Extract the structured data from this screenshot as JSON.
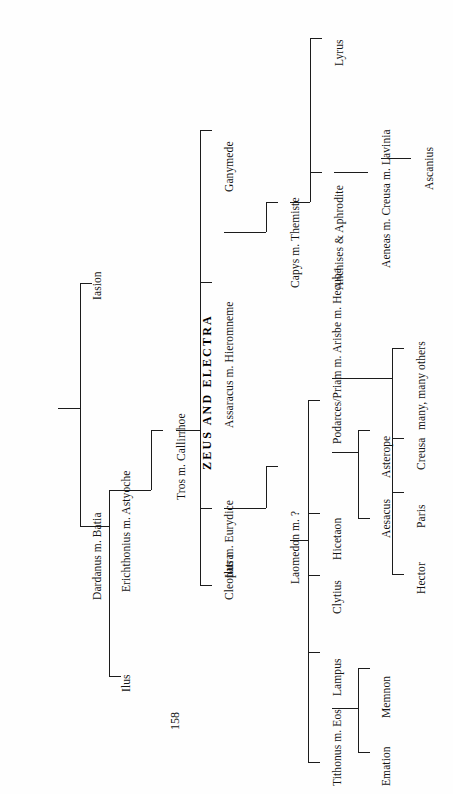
{
  "document": {
    "title": "ZEUS AND ELECTRA",
    "page_number": "158",
    "orientation": "rotated-90-ccw",
    "kind": "genealogy-chart"
  },
  "tree": {
    "root_label": "ZEUS AND ELECTRA",
    "generations": [
      {
        "level": 1,
        "nodes": [
          {
            "id": "iasion",
            "label": "Iasion"
          },
          {
            "id": "dardanus",
            "label": "Dardanus m. Batia"
          }
        ]
      },
      {
        "level": 2,
        "nodes": [
          {
            "id": "erichthonius",
            "label": "Erichthonius m. Astyoche"
          },
          {
            "id": "ilus1",
            "label": "Ilus"
          }
        ]
      },
      {
        "level": 3,
        "nodes": [
          {
            "id": "tros",
            "label": "Tros m. Callirrhoe"
          }
        ]
      },
      {
        "level": 4,
        "nodes": [
          {
            "id": "ganymede",
            "label": "Ganymede"
          },
          {
            "id": "assaracus",
            "label": "Assaracus m. Hieromneme"
          },
          {
            "id": "ilus2",
            "label": "Ilus m. Eurydice"
          },
          {
            "id": "cleopatra",
            "label": "Cleopatra"
          }
        ]
      },
      {
        "level": 5,
        "nodes": [
          {
            "id": "capys",
            "label": "Capys m. Themiste"
          },
          {
            "id": "laomedon",
            "label": "Laomedon m. ?"
          }
        ]
      },
      {
        "level": 6,
        "nodes": [
          {
            "id": "lyrus",
            "label": "Lyrus"
          },
          {
            "id": "anchises",
            "label": "Anchises & Aphrodite"
          },
          {
            "id": "hicetaon",
            "label": "Hicetaon"
          },
          {
            "id": "clytius",
            "label": "Clytius"
          },
          {
            "id": "lampus",
            "label": "Lampus"
          },
          {
            "id": "tithonus",
            "label": "Tithonus m. Eos"
          },
          {
            "id": "podarces",
            "label": "Podarces/Priam m. Arisbe  m. Hecuba"
          }
        ]
      },
      {
        "level": 7,
        "nodes": [
          {
            "id": "aeneas",
            "label": "Aeneas m. Creusa m. Lavinia"
          },
          {
            "id": "aesacus",
            "label": "Aesacus"
          },
          {
            "id": "asterope",
            "label": "Asterope"
          },
          {
            "id": "emation",
            "label": "Emation"
          },
          {
            "id": "memnon",
            "label": "Memnon"
          },
          {
            "id": "hector",
            "label": "Hector"
          },
          {
            "id": "paris",
            "label": "Paris"
          },
          {
            "id": "creusa",
            "label": "Creusa"
          },
          {
            "id": "many_others",
            "label": "many, many others"
          }
        ]
      },
      {
        "level": 8,
        "nodes": [
          {
            "id": "ascanius",
            "label": "Ascanius"
          }
        ]
      }
    ]
  },
  "labels": {
    "title": "ZEUS AND ELECTRA",
    "iasion": "Iasion",
    "dardanus": "Dardanus m. Batia",
    "erichthonius": "Erichthonius m. Astyoche",
    "ilus1": "Ilus",
    "tros": "Tros m. Callirrhoe",
    "ganymede": "Ganymede",
    "assaracus": "Assaracus m. Hieromneme",
    "ilus2": "Ilus m. Eurydice",
    "cleopatra": "Cleopatra",
    "capys": "Capys m. Themiste",
    "laomedon": "Laomedon m. ?",
    "lyrus": "Lyrus",
    "anchises": "Anchises & Aphrodite",
    "aeneas": "Aeneas m. Creusa m. Lavinia",
    "ascanius": "Ascanius",
    "hicetaon": "Hicetaon",
    "clytius": "Clytius",
    "lampus": "Lampus",
    "tithonus": "Tithonus m. Eos",
    "podarces": "Podarces/Priam m. Arisbe  m. Hecuba",
    "aesacus": "Aesacus",
    "asterope": "Asterope",
    "emation": "Emation",
    "memnon": "Memnon",
    "hector": "Hector",
    "paris": "Paris",
    "creusa": "Creusa",
    "many_others": "many, many others",
    "page_number": "158"
  },
  "style": {
    "line_color": "#1c1c1c",
    "text_color": "#131313",
    "background": "#ffffff"
  }
}
